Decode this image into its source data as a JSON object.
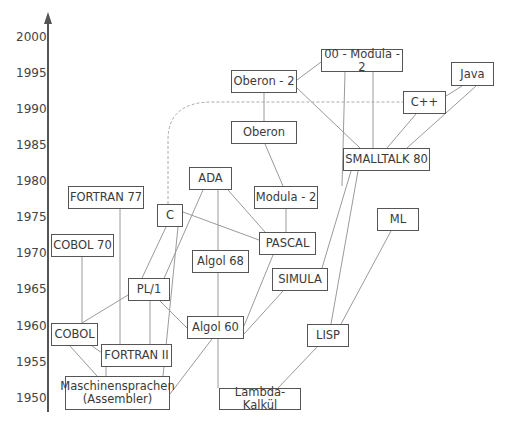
{
  "axis": {
    "ticks": [
      {
        "label": "2000",
        "y": 37
      },
      {
        "label": "1995",
        "y": 73
      },
      {
        "label": "1990",
        "y": 109
      },
      {
        "label": "1985",
        "y": 145
      },
      {
        "label": "1980",
        "y": 181
      },
      {
        "label": "1975",
        "y": 217
      },
      {
        "label": "1970",
        "y": 253
      },
      {
        "label": "1965",
        "y": 289
      },
      {
        "label": "1960",
        "y": 326
      },
      {
        "label": "1955",
        "y": 362
      },
      {
        "label": "1950",
        "y": 398
      }
    ]
  },
  "nodes": [
    {
      "id": "oomodula2",
      "label": "00 - Modula - 2",
      "x": 321,
      "y": 49,
      "w": 82,
      "h": 23
    },
    {
      "id": "oberon2",
      "label": "Oberon - 2",
      "x": 231,
      "y": 70,
      "w": 66,
      "h": 23
    },
    {
      "id": "java",
      "label": "Java",
      "x": 451,
      "y": 62,
      "w": 43,
      "h": 24
    },
    {
      "id": "cpp",
      "label": "C++",
      "x": 403,
      "y": 91,
      "w": 43,
      "h": 23
    },
    {
      "id": "oberon",
      "label": "Oberon",
      "x": 231,
      "y": 121,
      "w": 66,
      "h": 23
    },
    {
      "id": "smalltalk80",
      "label": "SMALLTALK 80",
      "x": 343,
      "y": 148,
      "w": 87,
      "h": 23
    },
    {
      "id": "ada",
      "label": "ADA",
      "x": 189,
      "y": 167,
      "w": 43,
      "h": 23
    },
    {
      "id": "fortran77",
      "label": "FORTRAN 77",
      "x": 68,
      "y": 186,
      "w": 76,
      "h": 23
    },
    {
      "id": "modula2",
      "label": "Modula - 2",
      "x": 254,
      "y": 186,
      "w": 64,
      "h": 23
    },
    {
      "id": "c",
      "label": "C",
      "x": 157,
      "y": 204,
      "w": 26,
      "h": 23
    },
    {
      "id": "pascal",
      "label": "PASCAL",
      "x": 259,
      "y": 232,
      "w": 57,
      "h": 23
    },
    {
      "id": "ml",
      "label": "ML",
      "x": 377,
      "y": 208,
      "w": 42,
      "h": 23
    },
    {
      "id": "cobol70",
      "label": "COBOL 70",
      "x": 51,
      "y": 234,
      "w": 63,
      "h": 23
    },
    {
      "id": "algol68",
      "label": "Algol 68",
      "x": 192,
      "y": 250,
      "w": 57,
      "h": 23
    },
    {
      "id": "simula",
      "label": "SIMULA",
      "x": 272,
      "y": 268,
      "w": 56,
      "h": 23
    },
    {
      "id": "pl1",
      "label": "PL/1",
      "x": 128,
      "y": 278,
      "w": 42,
      "h": 23
    },
    {
      "id": "algol60",
      "label": "Algol 60",
      "x": 187,
      "y": 316,
      "w": 57,
      "h": 23
    },
    {
      "id": "lisp",
      "label": "LISP",
      "x": 307,
      "y": 324,
      "w": 42,
      "h": 23
    },
    {
      "id": "cobol",
      "label": "COBOL",
      "x": 51,
      "y": 323,
      "w": 47,
      "h": 23
    },
    {
      "id": "fortran2",
      "label": "FORTRAN II",
      "x": 101,
      "y": 344,
      "w": 71,
      "h": 23
    },
    {
      "id": "asm",
      "label": "Maschinensprachen\n(Assembler)",
      "x": 65,
      "y": 376,
      "w": 105,
      "h": 34
    },
    {
      "id": "lambda",
      "label": "Lambda-Kalkül",
      "x": 219,
      "y": 388,
      "w": 82,
      "h": 22
    }
  ],
  "edges": [
    [
      106,
      376,
      106,
      367
    ],
    [
      70,
      346,
      97,
      376
    ],
    [
      92,
      346,
      105,
      355
    ],
    [
      120,
      344,
      120,
      209
    ],
    [
      82,
      323,
      82,
      257
    ],
    [
      82,
      323,
      128,
      295
    ],
    [
      150,
      301,
      150,
      344
    ],
    [
      163,
      376,
      178,
      227
    ],
    [
      170,
      394,
      212,
      339
    ],
    [
      160,
      301,
      187,
      328
    ],
    [
      142,
      278,
      166,
      227
    ],
    [
      162,
      283,
      203,
      190
    ],
    [
      183,
      212,
      259,
      240
    ],
    [
      218,
      339,
      218,
      388
    ],
    [
      218,
      316,
      218,
      190
    ],
    [
      228,
      190,
      265,
      232
    ],
    [
      244,
      326,
      273,
      255
    ],
    [
      244,
      334,
      283,
      291
    ],
    [
      286,
      232,
      286,
      209
    ],
    [
      283,
      186,
      265,
      144
    ],
    [
      264,
      121,
      264,
      93
    ],
    [
      297,
      80,
      321,
      62
    ],
    [
      297,
      88,
      360,
      148
    ],
    [
      342,
      186,
      345,
      72
    ],
    [
      373,
      148,
      373,
      72
    ],
    [
      387,
      148,
      416,
      114
    ],
    [
      446,
      96,
      462,
      86
    ],
    [
      407,
      148,
      476,
      86
    ],
    [
      322,
      268,
      351,
      171
    ],
    [
      331,
      324,
      358,
      171
    ],
    [
      341,
      324,
      391,
      231
    ],
    [
      278,
      388,
      317,
      347
    ]
  ],
  "dashed_path": "M 168 204 L 168 140 Q 168 102 212 102 L 403 102",
  "colors": {
    "line": "#9a9a9a",
    "box_border": "#555555",
    "axis": "#555555",
    "dash": "#aaaaaa"
  }
}
